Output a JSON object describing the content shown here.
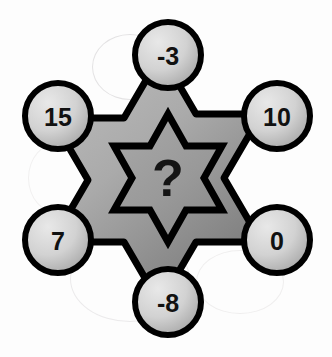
{
  "figure": {
    "center": {
      "label": "?",
      "name": "unknown-value"
    },
    "nodes": [
      {
        "id": "top",
        "label": "-3",
        "cx": 168,
        "cy": 55,
        "r": 33
      },
      {
        "id": "upper-right",
        "label": "10",
        "cx": 277,
        "cy": 116,
        "r": 33
      },
      {
        "id": "lower-right",
        "label": "0",
        "cx": 277,
        "cy": 240,
        "r": 33
      },
      {
        "id": "bottom",
        "label": "-8",
        "cx": 168,
        "cy": 302,
        "r": 33
      },
      {
        "id": "lower-left",
        "label": "7",
        "cx": 58,
        "cy": 240,
        "r": 33
      },
      {
        "id": "upper-left",
        "label": "15",
        "cx": 58,
        "cy": 116,
        "r": 33
      }
    ],
    "colors": {
      "outline": "#000000",
      "outer_star_light": "#b4b4b4",
      "outer_star_dark": "#8c8c8c",
      "inner_star_fill": "#9a9a9a",
      "circle_light": "#dedede",
      "circle_dark": "#a9a9a9",
      "background": "#fdfdfd",
      "text": "#111111"
    }
  }
}
